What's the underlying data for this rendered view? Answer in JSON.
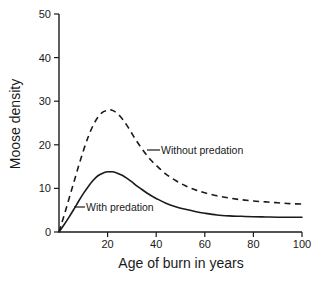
{
  "chart_data": {
    "type": "line",
    "title": "",
    "xlabel": "Age of burn in years",
    "ylabel": "Moose density",
    "xlim": [
      0,
      100
    ],
    "ylim": [
      0,
      50
    ],
    "grid": false,
    "legend_position": "inline-annotations",
    "x_ticks": [
      "20",
      "40",
      "60",
      "80",
      "100"
    ],
    "x_tick_values": [
      20,
      40,
      60,
      80,
      100
    ],
    "y_ticks": [
      "0",
      "10",
      "20",
      "30",
      "40",
      "50"
    ],
    "y_tick_values": [
      0,
      10,
      20,
      30,
      40,
      50
    ],
    "x": [
      0,
      2,
      4,
      6,
      8,
      10,
      12,
      14,
      16,
      18,
      20,
      21,
      22,
      24,
      26,
      28,
      30,
      32,
      34,
      36,
      38,
      40,
      44,
      48,
      52,
      56,
      60,
      65,
      70,
      75,
      80,
      85,
      90,
      95,
      100
    ],
    "series": [
      {
        "name": "Without predation",
        "style": "dashed",
        "annotation": "Without predation",
        "peak_x": 21,
        "peak_y": 28,
        "end_y": 6.3,
        "values": [
          0,
          3.6,
          7.4,
          11.2,
          15.0,
          18.6,
          21.8,
          24.4,
          26.3,
          27.5,
          27.9,
          28.0,
          27.9,
          27.2,
          26.0,
          24.4,
          22.6,
          20.8,
          19.2,
          17.7,
          16.4,
          15.3,
          13.3,
          11.8,
          10.6,
          9.7,
          9.0,
          8.3,
          7.8,
          7.4,
          7.1,
          6.9,
          6.7,
          6.5,
          6.4
        ]
      },
      {
        "name": "With predation",
        "style": "solid",
        "annotation": "With predation",
        "peak_x": 21,
        "peak_y": 13.8,
        "end_y": 3.4,
        "values": [
          0,
          1.6,
          3.3,
          5.1,
          7.0,
          8.8,
          10.4,
          11.8,
          12.9,
          13.5,
          13.8,
          13.8,
          13.8,
          13.5,
          13.0,
          12.3,
          11.5,
          10.6,
          9.8,
          9.0,
          8.3,
          7.7,
          6.6,
          5.8,
          5.2,
          4.7,
          4.3,
          3.9,
          3.7,
          3.6,
          3.5,
          3.45,
          3.4,
          3.4,
          3.4
        ]
      }
    ],
    "colors": {
      "axis": "#1a1a1a",
      "series_without_predation": "#1a1a1a",
      "series_with_predation": "#1a1a1a",
      "background": "#ffffff"
    }
  }
}
